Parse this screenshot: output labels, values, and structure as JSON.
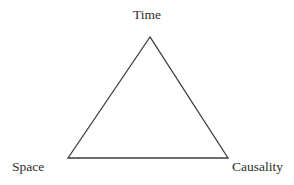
{
  "diagram": {
    "type": "triangle",
    "labels": {
      "top": "Time",
      "bottom_left": "Space",
      "bottom_right": "Causality"
    },
    "line_color": "#3c3c3c",
    "text_color": "#2e2e2e",
    "background_color": "#ffffff"
  }
}
